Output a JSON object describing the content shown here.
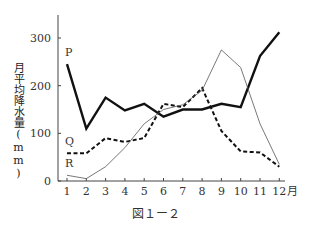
{
  "chart_data": {
    "type": "line",
    "title": "",
    "caption": "図１ー２",
    "xlabel": "月",
    "ylabel": "月平均降水量(mm)",
    "categories": [
      "1",
      "2",
      "3",
      "4",
      "5",
      "6",
      "7",
      "8",
      "9",
      "10",
      "11",
      "12"
    ],
    "ylim": [
      0,
      350
    ],
    "yticks": [
      0,
      100,
      200,
      300
    ],
    "grid": false,
    "series": [
      {
        "name": "P",
        "style": "thick-solid",
        "values": [
          245,
          110,
          175,
          148,
          162,
          135,
          150,
          150,
          162,
          155,
          262,
          312
        ]
      },
      {
        "name": "Q",
        "style": "dashed",
        "values": [
          58,
          58,
          90,
          82,
          90,
          162,
          155,
          195,
          105,
          62,
          60,
          30
        ]
      },
      {
        "name": "R",
        "style": "thin-solid",
        "values": [
          12,
          5,
          30,
          70,
          120,
          150,
          160,
          190,
          275,
          238,
          120,
          35
        ]
      }
    ]
  },
  "labels": {
    "ylabel": "月平均降水量(mm)",
    "xunit": "月",
    "caption": "図１ー２"
  }
}
